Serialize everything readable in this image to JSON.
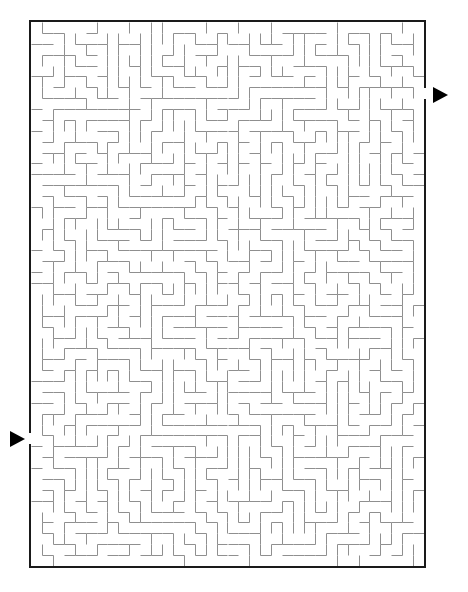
{
  "document": {
    "type": "maze-puzzle",
    "title": "Maze",
    "page_background": "#ffffff",
    "width": 468,
    "height": 592
  },
  "maze": {
    "name": "rectangular-perfect-maze",
    "columns": 36,
    "rows": 50,
    "cell_size": 10.9,
    "origin_x": 31,
    "origin_y": 22,
    "inner_width": 393,
    "inner_height": 544,
    "border_color": "#1a1a1a",
    "border_thickness": 2,
    "wall_color": "#8f8f8f",
    "wall_thickness": 1,
    "passage_color": "#ffffff",
    "seed": 20240917,
    "entrance": {
      "name": "entrance-gap",
      "side": "left",
      "row": 38,
      "x": 31,
      "y": 433,
      "gap_height": 11
    },
    "exit": {
      "name": "exit-gap",
      "side": "right",
      "row": 6,
      "x": 424,
      "y": 88,
      "gap_height": 11
    }
  },
  "markers": [
    {
      "name": "exit-arrow",
      "shape": "triangle-right",
      "color": "#000000",
      "x": 433,
      "y": 87,
      "width": 15,
      "height": 16,
      "label": "exit"
    },
    {
      "name": "entrance-arrow",
      "shape": "triangle-right",
      "color": "#000000",
      "x": 10,
      "y": 431,
      "width": 15,
      "height": 16,
      "label": "entrance"
    }
  ]
}
